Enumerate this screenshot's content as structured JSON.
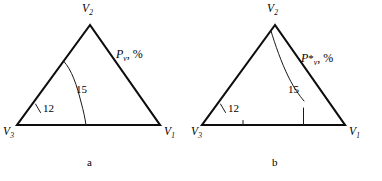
{
  "figure": {
    "type": "two-panel-line-diagram",
    "background_color": "#ffffff",
    "line_color": "#0d0d0d",
    "panels": [
      {
        "id": "a",
        "caption": "a",
        "vertices": [
          {
            "name": "V1",
            "base": "V",
            "sub": "1",
            "position": "bottom-right"
          },
          {
            "name": "V2",
            "base": "V",
            "sub": "2",
            "position": "top"
          },
          {
            "name": "V3",
            "base": "V",
            "sub": "3",
            "position": "bottom-left"
          }
        ],
        "axis_label": {
          "base": "P",
          "star": "",
          "sub": "v",
          "comma": ",",
          "unit": "%"
        },
        "annotations": [
          {
            "value": "15",
            "kind": "interior-curve-label"
          },
          {
            "value": "12",
            "kind": "left-edge-tick-label"
          }
        ]
      },
      {
        "id": "b",
        "caption": "b",
        "vertices": [
          {
            "name": "V1",
            "base": "V",
            "sub": "1",
            "position": "bottom-right"
          },
          {
            "name": "V2",
            "base": "V",
            "sub": "2",
            "position": "top"
          },
          {
            "name": "V3",
            "base": "V",
            "sub": "3",
            "position": "bottom-left"
          }
        ],
        "axis_label": {
          "base": "P",
          "star": "*",
          "sub": "v",
          "comma": ",",
          "unit": "%"
        },
        "annotations": [
          {
            "value": "15",
            "kind": "interior-curve-label"
          },
          {
            "value": "12",
            "kind": "left-edge-tick-label"
          }
        ]
      }
    ]
  },
  "panel_a": {
    "vertex_top": "V",
    "vertex_top_sub": "2",
    "vertex_left": "V",
    "vertex_left_sub": "3",
    "vertex_right": "V",
    "vertex_right_sub": "1",
    "label_15": "15",
    "label_12": "12",
    "axis_base": "P",
    "axis_star": "",
    "axis_sub": "v",
    "axis_comma": ",",
    "axis_unit": "%",
    "caption": "a"
  },
  "panel_b": {
    "vertex_top": "V",
    "vertex_top_sub": "2",
    "vertex_left": "V",
    "vertex_left_sub": "3",
    "vertex_right": "V",
    "vertex_right_sub": "1",
    "label_15": "15",
    "label_12": "12",
    "axis_base": "P",
    "axis_star": "*",
    "axis_sub": "v",
    "axis_comma": ",",
    "axis_unit": "%",
    "caption": "b"
  }
}
